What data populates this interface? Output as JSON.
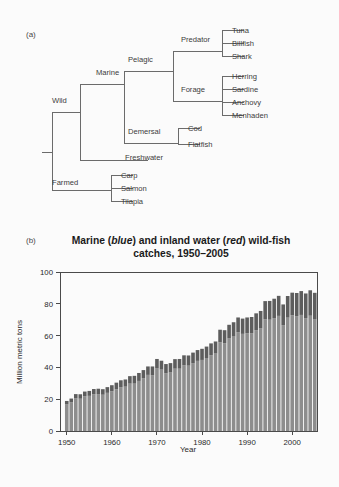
{
  "figure": {
    "panel_a_tag": "(a)",
    "panel_b_tag": "(b)"
  },
  "tree": {
    "root_label": "",
    "nodes": [
      {
        "id": "wild",
        "label": "Wild",
        "x": 52,
        "y": 103
      },
      {
        "id": "farmed",
        "label": "Farmed",
        "x": 52,
        "y": 185
      },
      {
        "id": "marine",
        "label": "Marine",
        "x": 96,
        "y": 75
      },
      {
        "id": "freshwater",
        "label": "Freshwater",
        "x": 125,
        "y": 160
      },
      {
        "id": "pelagic",
        "label": "Pelagic",
        "x": 128,
        "y": 62
      },
      {
        "id": "demersal",
        "label": "Demersal",
        "x": 128,
        "y": 134
      },
      {
        "id": "predator",
        "label": "Predator",
        "x": 181,
        "y": 42
      },
      {
        "id": "forage",
        "label": "Forage",
        "x": 181,
        "y": 92
      },
      {
        "id": "tuna",
        "label": "Tuna",
        "x": 232,
        "y": 33
      },
      {
        "id": "billfish",
        "label": "Billfish",
        "x": 232,
        "y": 46
      },
      {
        "id": "shark",
        "label": "Shark",
        "x": 232,
        "y": 59
      },
      {
        "id": "herring",
        "label": "Herring",
        "x": 232,
        "y": 79
      },
      {
        "id": "sardine",
        "label": "Sardine",
        "x": 232,
        "y": 92
      },
      {
        "id": "anchovy",
        "label": "Anchovy",
        "x": 232,
        "y": 105
      },
      {
        "id": "menhaden",
        "label": "Menhaden",
        "x": 232,
        "y": 118
      },
      {
        "id": "cod",
        "label": "Cod",
        "x": 188,
        "y": 131
      },
      {
        "id": "flatfish",
        "label": "Flatfish",
        "x": 188,
        "y": 147
      },
      {
        "id": "carp",
        "label": "Carp",
        "x": 121,
        "y": 178
      },
      {
        "id": "salmon",
        "label": "Salmon",
        "x": 121,
        "y": 191
      },
      {
        "id": "tilapia",
        "label": "Tilapia",
        "x": 121,
        "y": 204
      }
    ],
    "line_color": "#6b6b6b"
  },
  "chart_data": {
    "type": "bar",
    "title": "Marine (blue) and inland water (red) wild-fish catches, 1950–2005",
    "title_parts": {
      "p1": "Marine (",
      "em1": "blue",
      "p2": ") and inland water (",
      "em2": "red",
      "p3": ") wild-fish",
      "line2": "catches, 1950–2005"
    },
    "xlabel": "Year",
    "ylabel": "Million metric tons",
    "ylim": [
      0,
      100
    ],
    "yticks": [
      0,
      20,
      40,
      60,
      80,
      100
    ],
    "ytick_labels": [
      "0",
      "20",
      "40",
      "60",
      "80",
      "100"
    ],
    "xlim": [
      1949,
      2006
    ],
    "xticks": [
      1950,
      1960,
      1970,
      1980,
      1990,
      2000
    ],
    "xtick_labels": [
      "1950",
      "1960",
      "1970",
      "1980",
      "1990",
      "2000"
    ],
    "grid": false,
    "legend": "in-title",
    "stacked": true,
    "series": [
      {
        "name": "Marine",
        "color": "#8d8d8d",
        "values": [
          16.7,
          18.0,
          20.5,
          20.3,
          21.8,
          22.1,
          23.1,
          23.2,
          22.8,
          24.0,
          25.0,
          26.3,
          27.6,
          27.9,
          29.8,
          29.8,
          31.5,
          33.2,
          35.3,
          35.1,
          39.6,
          38.6,
          36.3,
          36.8,
          39.2,
          39.2,
          41.4,
          41.1,
          42.7,
          44.1,
          44.7,
          45.9,
          47.7,
          48.7,
          55.8,
          55.2,
          58.2,
          59.4,
          62.1,
          61.1,
          61.5,
          61.5,
          63.4,
          64.5,
          70.3,
          70.0,
          71.0,
          72.4,
          66.6,
          71.3,
          72.8,
          72.2,
          73.0,
          71.0,
          72.5,
          70.4
        ],
        "unit": "Million metric tons"
      },
      {
        "name": "Inland water",
        "color": "#5d5d5d",
        "values": [
          2.2,
          2.4,
          2.7,
          2.8,
          3.0,
          3.1,
          3.3,
          3.4,
          3.5,
          3.6,
          3.8,
          4.1,
          4.3,
          4.5,
          4.7,
          4.9,
          5.0,
          5.1,
          5.3,
          5.5,
          5.7,
          5.6,
          5.8,
          5.9,
          6.0,
          6.1,
          6.2,
          6.4,
          6.6,
          6.8,
          7.0,
          7.2,
          7.4,
          7.6,
          7.9,
          8.2,
          8.6,
          9.0,
          9.3,
          9.6,
          9.9,
          10.2,
          10.6,
          11.0,
          11.4,
          11.8,
          12.2,
          12.6,
          13.0,
          13.6,
          14.2,
          14.6,
          15.0,
          15.5,
          16.0,
          16.5
        ],
        "unit": "Million metric tons"
      }
    ],
    "x": [
      1950,
      1951,
      1952,
      1953,
      1954,
      1955,
      1956,
      1957,
      1958,
      1959,
      1960,
      1961,
      1962,
      1963,
      1964,
      1965,
      1966,
      1967,
      1968,
      1969,
      1970,
      1971,
      1972,
      1973,
      1974,
      1975,
      1976,
      1977,
      1978,
      1979,
      1980,
      1981,
      1982,
      1983,
      1984,
      1985,
      1986,
      1987,
      1988,
      1989,
      1990,
      1991,
      1992,
      1993,
      1994,
      1995,
      1996,
      1997,
      1998,
      1999,
      2000,
      2001,
      2002,
      2003,
      2004,
      2005
    ]
  }
}
